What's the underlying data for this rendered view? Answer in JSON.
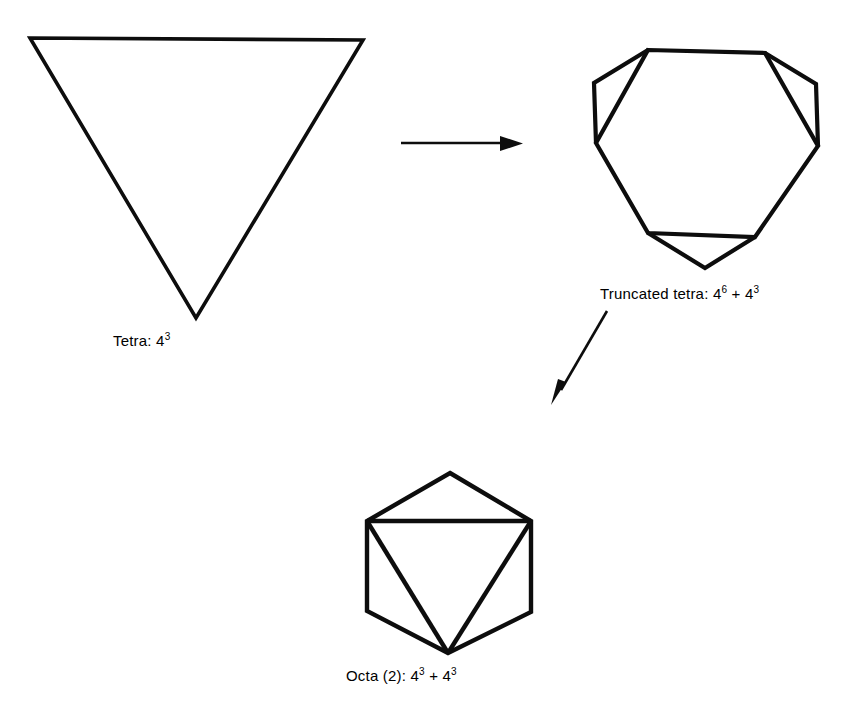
{
  "figure": {
    "background_color": "#ffffff",
    "stroke_color": "#0d0d0d"
  },
  "shapes": [
    {
      "id": "tetra",
      "name": "tetrahedron",
      "label_base": "Tetra: 4",
      "label_sup": "3",
      "label_full": "Tetra: 4³",
      "faces": "4",
      "exponent": "3"
    },
    {
      "id": "truncated-tetra",
      "name": "truncated tetrahedron",
      "label_base": "Truncated tetra: 4",
      "label_sup": "6",
      "label_mid": " + 4",
      "label_sup2": "3",
      "label_full": "Truncated tetra: 4⁶ + 4³",
      "hexagon_faces": "4",
      "hexagon_exponent": "6",
      "triangle_faces": "4",
      "triangle_exponent": "3"
    },
    {
      "id": "octa",
      "name": "octahedron",
      "label_base": "Octa (2): 4",
      "label_sup": "3",
      "label_mid": " + 4",
      "label_sup2": "3",
      "label_full": "Octa (2): 4³ + 4³",
      "multiplicity": "2",
      "faces": "4",
      "exponent": "3"
    }
  ],
  "arrows": [
    {
      "id": "arrow-tetra-to-truncated",
      "direction": "right",
      "from": "tetra",
      "to": "truncated-tetra"
    },
    {
      "id": "arrow-truncated-to-octa",
      "direction": "down-left",
      "from": "truncated-tetra",
      "to": "octa"
    }
  ],
  "captions": {
    "tetra": "Tetra: 4",
    "tetra_sup": "3",
    "truncated_prefix": "Truncated tetra: 4",
    "truncated_sup1": "6",
    "truncated_plus": " + 4",
    "truncated_sup2": "3",
    "octa_prefix": "Octa (2): 4",
    "octa_sup1": "3",
    "octa_plus": " + 4",
    "octa_sup2": "3"
  }
}
